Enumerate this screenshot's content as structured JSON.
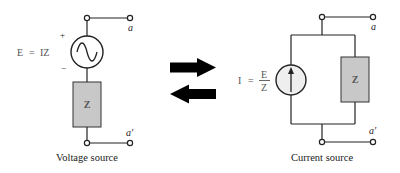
{
  "colors": {
    "line": "#222222",
    "impedance_fill": "#c8c8c8",
    "current_source_fill": "#eeeeee",
    "arrow": "#000000"
  },
  "voltage_source": {
    "equation_lhs": "E",
    "equation_eq": "=",
    "equation_rhs": "IZ",
    "plus": "+",
    "minus": "−",
    "source_icon": "ac-sine-icon",
    "impedance_label": "Z",
    "terminal_top": "a",
    "terminal_bottom": "a′",
    "caption": "Voltage source"
  },
  "conversion_arrows": {
    "right": "arrow-right",
    "left": "arrow-left"
  },
  "current_source": {
    "equation_lhs": "I",
    "equation_eq": "=",
    "fraction_num": "E",
    "fraction_den": "Z",
    "source_icon": "current-arrow-up-icon",
    "impedance_label": "Z",
    "terminal_top": "a",
    "terminal_bottom": "a′",
    "caption": "Current source"
  }
}
